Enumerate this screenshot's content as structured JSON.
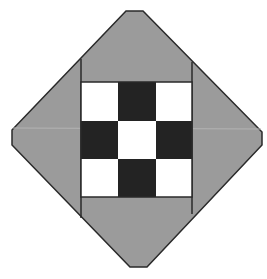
{
  "title": "Quilt block - nine patch on point",
  "colors": {
    "background": "#ffffff",
    "setting_gray": "#9b9b9b",
    "dark": "#232323",
    "light": "#ffffff",
    "outline": "#2a2a2a"
  },
  "outline_points": "126,11 143,11 262,132 262,145 147,267 130,267 12,145 12,130",
  "nine_patch": {
    "x": 81,
    "y": 82,
    "width": 111,
    "height": 115,
    "rows": [
      [
        "light",
        "dark",
        "light"
      ],
      [
        "dark",
        "light",
        "dark"
      ],
      [
        "light",
        "dark",
        "light"
      ]
    ]
  }
}
